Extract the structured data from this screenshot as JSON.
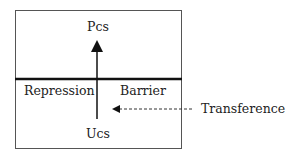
{
  "diagram": {
    "top_label": "Pcs",
    "bottom_label": "Ucs",
    "left_label": "Repression",
    "right_label": "Barrier",
    "external_label": "Transference",
    "colors": {
      "line": "#111111",
      "text": "#222222",
      "background": "#ffffff"
    }
  }
}
